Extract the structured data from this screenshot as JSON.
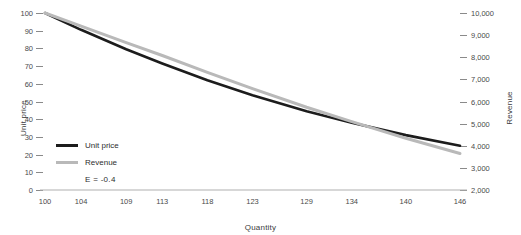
{
  "chart_data": {
    "type": "line",
    "title": "",
    "xlabel": "Quantity",
    "ylabel": "Unit price",
    "y2label": "Revenue",
    "grid": false,
    "legend_position": "inside-bottom-left",
    "x": [
      100,
      104,
      109,
      113,
      118,
      123,
      129,
      134,
      140,
      146
    ],
    "xtick_labels": [
      "100",
      "104",
      "109",
      "113",
      "118",
      "123",
      "129",
      "134",
      "140",
      "146"
    ],
    "xlim": [
      100,
      146
    ],
    "ylim": [
      0,
      100
    ],
    "ytick_labels": [
      "0",
      "10",
      "20",
      "30",
      "40",
      "50",
      "60",
      "70",
      "80",
      "90",
      "100"
    ],
    "ytick_values": [
      0,
      10,
      20,
      30,
      40,
      50,
      60,
      70,
      80,
      90,
      100
    ],
    "y2lim": [
      2000,
      10000
    ],
    "y2tick_labels": [
      "2,000",
      "3,000",
      "4,000",
      "5,000",
      "6,000",
      "7,000",
      "8,000",
      "9,000",
      "10,000"
    ],
    "y2tick_values": [
      2000,
      3000,
      4000,
      5000,
      6000,
      7000,
      8000,
      9000,
      10000
    ],
    "series": [
      {
        "name": "Unit price",
        "axis": "left",
        "color": "#1c1c1c",
        "values": [
          100,
          90.5,
          79.5,
          71.5,
          62.0,
          53.5,
          44.5,
          38.0,
          31.0,
          25.0
        ]
      },
      {
        "name": "Revenue",
        "axis": "right",
        "color": "#b9b9b9",
        "values": [
          10000,
          9410,
          8660,
          8080,
          7320,
          6580,
          5740,
          5090,
          4340,
          3650
        ]
      }
    ],
    "annotations": [
      {
        "text": "E = -0.4"
      }
    ]
  },
  "legend": {
    "items": [
      {
        "label": "Unit price",
        "color": "#1c1c1c"
      },
      {
        "label": "Revenue",
        "color": "#b9b9b9"
      }
    ],
    "note": "E = -0.4"
  },
  "axes": {
    "left_title": "Unit price",
    "right_title": "Revenue",
    "x_title": "Quantity"
  },
  "colors": {
    "unit_price": "#1c1c1c",
    "revenue": "#b9b9b9",
    "axis": "#b0b0b0",
    "text": "#3b3b3b"
  }
}
